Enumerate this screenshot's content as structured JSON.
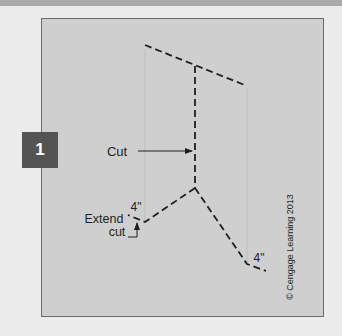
{
  "figure": {
    "step_number": "1",
    "labels": {
      "cut": "Cut",
      "extend_line1": "Extend",
      "extend_line2": "cut",
      "dim_left": "4\"",
      "dim_right": "4\"",
      "copyright": "© Cengage Learning 2013"
    },
    "colors": {
      "panel": "#cfcfcf",
      "badge": "#545454",
      "line": "#1e1e1e",
      "guide": "#bdbdbd"
    }
  }
}
